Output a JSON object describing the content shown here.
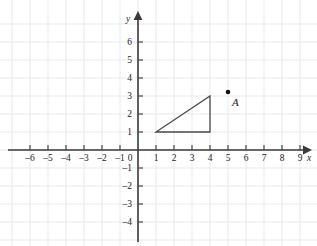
{
  "chart_data": {
    "type": "scatter",
    "title": "",
    "xlabel": "x",
    "ylabel": "y",
    "grid": true,
    "legend": false,
    "xlim": [
      -7,
      10
    ],
    "ylim": [
      -5,
      7
    ],
    "x_tick_labels": [
      "–6",
      "–5",
      "–4",
      "–3",
      "–2",
      "–1",
      "1",
      "2",
      "3",
      "4",
      "5",
      "6",
      "7",
      "8",
      "9"
    ],
    "x_tick_values": [
      -6,
      -5,
      -4,
      -3,
      -2,
      -1,
      1,
      2,
      3,
      4,
      5,
      6,
      7,
      8,
      9
    ],
    "y_tick_labels": [
      "6",
      "5",
      "4",
      "3",
      "2",
      "1",
      "–1",
      "–2",
      "–3",
      "–4"
    ],
    "y_tick_values": [
      6,
      5,
      4,
      3,
      2,
      1,
      -1,
      -2,
      -3,
      -4
    ],
    "origin_label": "0",
    "points": [
      {
        "label": "A",
        "x": 5,
        "y": 3
      }
    ],
    "shapes": [
      {
        "name": "triangle",
        "type": "polygon",
        "closed": true,
        "vertices": [
          [
            1,
            1
          ],
          [
            4,
            1
          ],
          [
            4,
            3
          ]
        ]
      }
    ],
    "colors": {
      "axis": "#3a3a3a",
      "grid": "#e9e9ef",
      "shape_stroke": "#4a4a4a",
      "point": "#111111",
      "text": "#1d1d1d",
      "background": "#ffffff"
    }
  },
  "axes": {
    "x_name": "x",
    "y_name": "y",
    "origin": "0"
  }
}
